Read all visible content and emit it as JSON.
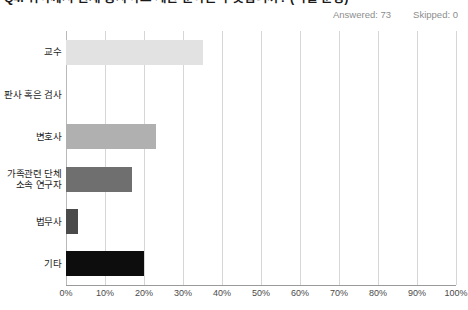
{
  "question": {
    "title": "Q4. 귀하께서 현재 종사하고 계신 분야는 무엇입니까? (택일 문항)"
  },
  "meta": {
    "answered_label": "Answered: 73",
    "skipped_label": "Skipped: 0"
  },
  "chart_data": {
    "type": "bar",
    "orientation": "horizontal",
    "title": "Q4. 귀하께서 현재 종사하고 계신 분야는 무엇입니까? (택일 문항)",
    "xlabel": "",
    "ylabel": "",
    "categories": [
      "교수",
      "판사 혹은 검사",
      "변호사",
      "가족관련 단체\n소속 연구자",
      "법무사",
      "기타"
    ],
    "values": [
      35,
      0,
      23,
      17,
      3,
      20
    ],
    "value_unit": "%",
    "xlim": [
      0,
      100
    ],
    "xticks": [
      "0%",
      "10%",
      "20%",
      "30%",
      "40%",
      "50%",
      "60%",
      "70%",
      "80%",
      "90%",
      "100%"
    ],
    "xtick_values": [
      0,
      10,
      20,
      30,
      40,
      50,
      60,
      70,
      80,
      90,
      100
    ],
    "grid": true,
    "legend": false,
    "bar_colors": [
      "#e2e2e2",
      "#bdbdbd",
      "#b0b0b0",
      "#6f6f6f",
      "#4a4a4a",
      "#0d0d0d"
    ]
  },
  "colors": {
    "grid": "#d6d6d6",
    "axis": "#9a9a9a",
    "meta_text": "#8d8d8d",
    "label_text": "#1d1d1d"
  }
}
